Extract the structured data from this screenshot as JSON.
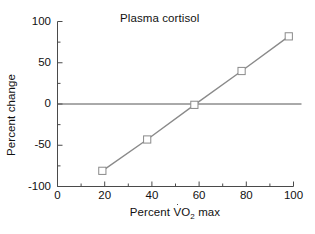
{
  "chart_data": {
    "type": "line",
    "title": "Plasma cortisol",
    "xlabel": "Percent V̇O₂ max",
    "xlabel_parts": {
      "prefix": "Percent ",
      "v": "V",
      "o": "O",
      "sub": "2",
      "suffix": " max"
    },
    "ylabel": "Percent change",
    "xlim": [
      0,
      100
    ],
    "ylim": [
      -100,
      100
    ],
    "grid": false,
    "legend": null,
    "x_major_ticks": [
      0,
      20,
      40,
      60,
      80,
      100
    ],
    "x_minor_ticks": [
      10,
      30,
      50,
      70,
      90
    ],
    "y_major_ticks": [
      -100,
      -50,
      0,
      50,
      100
    ],
    "y_minor_ticks": [
      -75,
      -25,
      25,
      75
    ],
    "x_tick_labels": [
      "0",
      "20",
      "40",
      "60",
      "80",
      "100"
    ],
    "y_tick_labels": [
      "-100",
      "-50",
      "0",
      "50",
      "100"
    ],
    "reference_line": {
      "y": 0,
      "color": "#555555"
    },
    "series": [
      {
        "name": "Plasma cortisol",
        "marker": "open-square",
        "line_color": "#8a8a8a",
        "marker_edge_color": "#8a8a8a",
        "marker_face_color": "#ffffff",
        "x": [
          19,
          38,
          58,
          78,
          98
        ],
        "values": [
          -81,
          -43,
          -1,
          40,
          82
        ]
      }
    ]
  },
  "colors": {
    "axis": "#4a4a4a",
    "line": "#8a8a8a",
    "zero_line": "#555555",
    "text": "#111111",
    "background": "#ffffff"
  }
}
